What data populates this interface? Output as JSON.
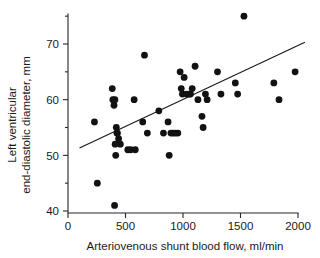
{
  "chart_data": {
    "type": "scatter",
    "title": "",
    "xlabel": "Arteriovenous shunt blood flow, ml/min",
    "ylabel_line1": "Left ventricular",
    "ylabel_line2": "end-diastolic diameter, mm",
    "xlim": [
      0,
      2000
    ],
    "ylim": [
      39,
      76
    ],
    "xticks": [
      0,
      500,
      1000,
      1500,
      2000
    ],
    "xtick_labels": [
      "0",
      "500",
      "1000",
      "1500",
      "2000"
    ],
    "yticks": [
      40,
      50,
      60,
      70
    ],
    "ytick_labels": [
      "40",
      "50",
      "60",
      "70"
    ],
    "yminor_ticks": [
      45,
      55,
      65,
      75
    ],
    "grid": false,
    "legend": null,
    "marker": "filled-circle",
    "marker_color": "#121212",
    "marker_size_px": 4.6,
    "series": [
      {
        "name": "patients",
        "points": [
          [
            230,
            56
          ],
          [
            255,
            45
          ],
          [
            385,
            62
          ],
          [
            390,
            60
          ],
          [
            400,
            59
          ],
          [
            405,
            41
          ],
          [
            408,
            60
          ],
          [
            410,
            52
          ],
          [
            415,
            50
          ],
          [
            420,
            55
          ],
          [
            425,
            54
          ],
          [
            430,
            54
          ],
          [
            440,
            53
          ],
          [
            455,
            52
          ],
          [
            520,
            51
          ],
          [
            545,
            51
          ],
          [
            575,
            60
          ],
          [
            585,
            51
          ],
          [
            650,
            56
          ],
          [
            665,
            68
          ],
          [
            690,
            54
          ],
          [
            790,
            58
          ],
          [
            830,
            54
          ],
          [
            870,
            56
          ],
          [
            880,
            50
          ],
          [
            895,
            54
          ],
          [
            915,
            54
          ],
          [
            935,
            54
          ],
          [
            955,
            54
          ],
          [
            975,
            65
          ],
          [
            985,
            62
          ],
          [
            995,
            61
          ],
          [
            1010,
            64
          ],
          [
            1030,
            61
          ],
          [
            1055,
            61
          ],
          [
            1065,
            61
          ],
          [
            1080,
            62
          ],
          [
            1105,
            66
          ],
          [
            1130,
            60
          ],
          [
            1165,
            57
          ],
          [
            1175,
            55
          ],
          [
            1195,
            61
          ],
          [
            1210,
            60
          ],
          [
            1300,
            65
          ],
          [
            1330,
            61
          ],
          [
            1455,
            63
          ],
          [
            1475,
            61
          ],
          [
            1530,
            75
          ],
          [
            1790,
            63
          ],
          [
            1835,
            60
          ],
          [
            1975,
            65
          ]
        ]
      }
    ],
    "trend_line": {
      "name": "regression-line",
      "x_start": 100,
      "y_start": 51.3,
      "x_end": 2060,
      "y_end": 70.3,
      "color": "#1a1a1a"
    }
  }
}
